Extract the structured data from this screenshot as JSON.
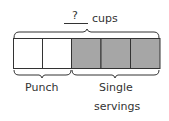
{
  "diagram": {
    "type": "tape-diagram",
    "top_label": {
      "blank_value": "?",
      "unit": "cups"
    },
    "boxes": [
      {
        "segment": "Punch",
        "shaded": false
      },
      {
        "segment": "Punch",
        "shaded": false
      },
      {
        "segment": "Single servings",
        "shaded": true
      },
      {
        "segment": "Single servings",
        "shaded": true
      },
      {
        "segment": "Single servings",
        "shaded": true
      }
    ],
    "bottom_labels": {
      "punch": "Punch",
      "single_line1": "Single",
      "single_line2": "servings"
    },
    "colors": {
      "shaded": "#a6a6a6",
      "unshaded": "#ffffff",
      "stroke": "#333333"
    }
  }
}
